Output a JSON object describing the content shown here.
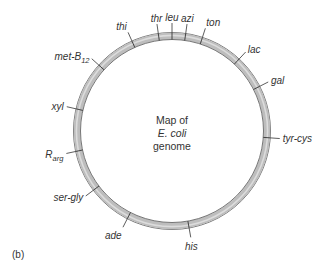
{
  "diagram": {
    "title_lines": [
      "Map of",
      "E. coli",
      "genome"
    ],
    "panel_label": "(b)",
    "ring_colors": {
      "band": "#bdbdbd",
      "highlight": "#dcdcdc",
      "outline": "#555555"
    },
    "markers": [
      {
        "name": "thr",
        "angle_deg": -8
      },
      {
        "name": "leu",
        "angle_deg": 0
      },
      {
        "name": "azi",
        "angle_deg": 8
      },
      {
        "name": "ton",
        "angle_deg": 18
      },
      {
        "name": "lac",
        "angle_deg": 43
      },
      {
        "name": "gal",
        "angle_deg": 63
      },
      {
        "name": "tyr-cys",
        "angle_deg": 94
      },
      {
        "name": "his",
        "angle_deg": 170
      },
      {
        "name": "ade",
        "angle_deg": 207
      },
      {
        "name": "ser-gly",
        "angle_deg": 233
      },
      {
        "name": "R",
        "sub": "arg",
        "angle_deg": 258
      },
      {
        "name": "xyl",
        "angle_deg": 283
      },
      {
        "name": "met-B",
        "sub": "12",
        "angle_deg": 312
      },
      {
        "name": "thi",
        "angle_deg": 336
      }
    ]
  }
}
